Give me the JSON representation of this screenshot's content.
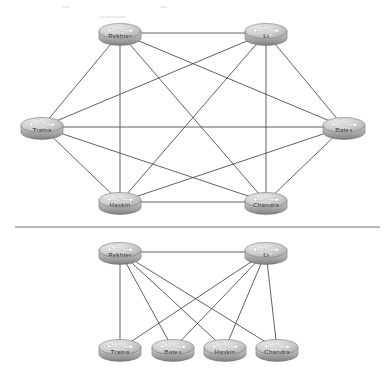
{
  "figure": {
    "background_color": "#ffffff",
    "width": 387,
    "height": 378,
    "divider": {
      "name": "section-divider",
      "y": 227,
      "x1": 15,
      "x2": 380,
      "color": "#767676"
    }
  },
  "style": {
    "edge_color": "#4f4f4f",
    "router_body_light": "#e4e4e4",
    "router_body_mid": "#bdbdbd",
    "router_body_dark": "#8f8f8f",
    "router_top_light": "#d9d9d9",
    "router_arrow_color": "#ffffff",
    "label_color": "#4a4a4a"
  },
  "diagrams": [
    {
      "id": "full-mesh",
      "name": "full-mesh-topology",
      "description": "Full mesh IBGP topology with six routers, every router peered with every other router",
      "node_count": 6,
      "edge_count": 15,
      "nodes": [
        {
          "id": "rekhter",
          "label": "Rekhter",
          "x": 120,
          "y": 33
        },
        {
          "id": "li",
          "label": "Li",
          "x": 266,
          "y": 33
        },
        {
          "id": "traina",
          "label": "Traina",
          "x": 42,
          "y": 127
        },
        {
          "id": "bates",
          "label": "Bates",
          "x": 344,
          "y": 127
        },
        {
          "id": "haskin",
          "label": "Haskin",
          "x": 120,
          "y": 202
        },
        {
          "id": "chandra",
          "label": "Chandra",
          "x": 266,
          "y": 202
        }
      ],
      "edges": [
        [
          "rekhter",
          "li"
        ],
        [
          "rekhter",
          "traina"
        ],
        [
          "rekhter",
          "bates"
        ],
        [
          "rekhter",
          "haskin"
        ],
        [
          "rekhter",
          "chandra"
        ],
        [
          "li",
          "traina"
        ],
        [
          "li",
          "bates"
        ],
        [
          "li",
          "haskin"
        ],
        [
          "li",
          "chandra"
        ],
        [
          "traina",
          "bates"
        ],
        [
          "traina",
          "haskin"
        ],
        [
          "traina",
          "chandra"
        ],
        [
          "bates",
          "haskin"
        ],
        [
          "bates",
          "chandra"
        ],
        [
          "haskin",
          "chandra"
        ]
      ]
    },
    {
      "id": "route-reflector",
      "name": "route-reflector-topology",
      "description": "Route reflector topology: two reflectors peered together, each peered with four clients",
      "node_count": 6,
      "edge_count": 9,
      "nodes": [
        {
          "id": "rekhter2",
          "label": "Rekhter",
          "x": 120,
          "y": 252
        },
        {
          "id": "li2",
          "label": "Li",
          "x": 266,
          "y": 252
        },
        {
          "id": "traina2",
          "label": "Traina",
          "x": 120,
          "y": 349
        },
        {
          "id": "bates2",
          "label": "Bates",
          "x": 173,
          "y": 349
        },
        {
          "id": "haskin2",
          "label": "Haskin",
          "x": 225,
          "y": 349
        },
        {
          "id": "chandra2",
          "label": "Chandra",
          "x": 277,
          "y": 349
        }
      ],
      "edges": [
        [
          "rekhter2",
          "li2"
        ],
        [
          "rekhter2",
          "traina2"
        ],
        [
          "rekhter2",
          "bates2"
        ],
        [
          "rekhter2",
          "haskin2"
        ],
        [
          "rekhter2",
          "chandra2"
        ],
        [
          "li2",
          "traina2"
        ],
        [
          "li2",
          "bates2"
        ],
        [
          "li2",
          "haskin2"
        ],
        [
          "li2",
          "chandra2"
        ]
      ]
    }
  ],
  "icon": {
    "name": "router-icon",
    "shape": "cylinder-disc",
    "glyph": "four-arrow-cross",
    "width": 44,
    "height": 26
  }
}
